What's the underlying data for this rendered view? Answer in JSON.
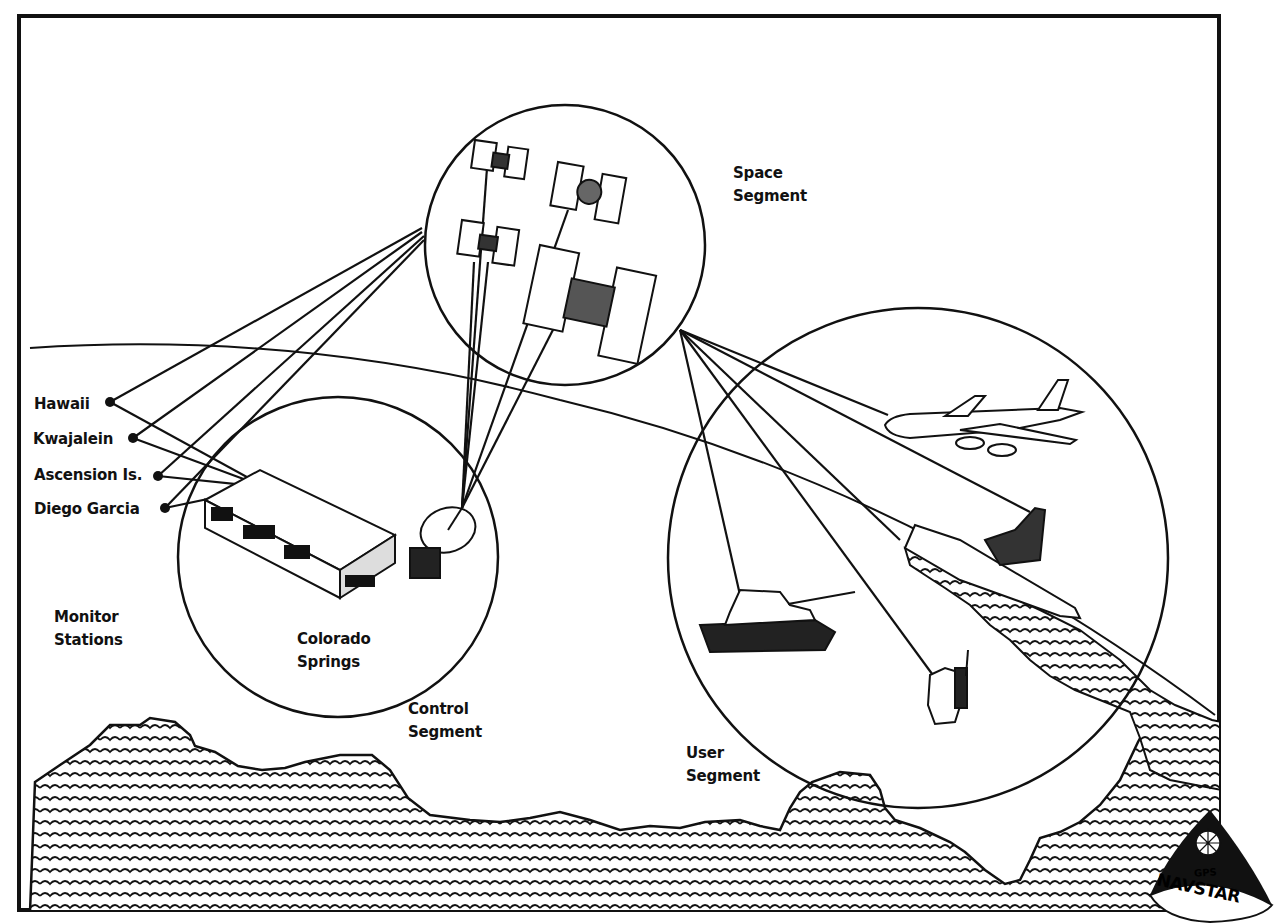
{
  "colors": {
    "ink": "#111111",
    "paper": "#ffffff"
  },
  "segments": {
    "space": {
      "line1": "Space",
      "line2": "Segment"
    },
    "control": {
      "line1": "Control",
      "line2": "Segment"
    },
    "user": {
      "line1": "User",
      "line2": "Segment"
    }
  },
  "master_station": {
    "line1": "Colorado",
    "line2": "Springs"
  },
  "monitor_stations": {
    "heading1": "Monitor",
    "heading2": "Stations",
    "items": [
      {
        "label": "Hawaii"
      },
      {
        "label": "Kwajalein"
      },
      {
        "label": "Ascension Is."
      },
      {
        "label": "Diego Garcia"
      }
    ]
  },
  "user_equipment": [
    "aircraft",
    "ship",
    "tank",
    "manpack soldier"
  ],
  "logo": {
    "top": "GPS",
    "bottom": "NAVSTAR"
  }
}
